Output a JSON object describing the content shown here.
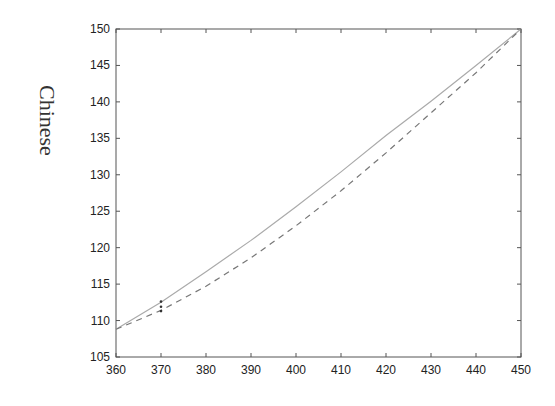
{
  "chart_data": {
    "type": "line",
    "title": "",
    "xlabel": "",
    "ylabel": "Chinese",
    "xlim": [
      360,
      450
    ],
    "ylim": [
      105,
      150
    ],
    "xticks": [
      360,
      370,
      380,
      390,
      400,
      410,
      420,
      430,
      440,
      450
    ],
    "yticks": [
      105,
      110,
      115,
      120,
      125,
      130,
      135,
      140,
      145,
      150
    ],
    "grid": false,
    "legend": null,
    "x": [
      360,
      370,
      380,
      390,
      400,
      410,
      420,
      430,
      440,
      450
    ],
    "series": [
      {
        "name": "solid",
        "style": "solid",
        "color": "#aaaaaa",
        "values": [
          108.8,
          112.5,
          116.7,
          121.0,
          125.6,
          130.4,
          135.4,
          140.1,
          145.0,
          150.0
        ]
      },
      {
        "name": "dashed",
        "style": "dashed",
        "color": "#777777",
        "values": [
          108.8,
          111.4,
          114.7,
          118.6,
          123.0,
          127.8,
          133.0,
          138.5,
          144.0,
          150.0
        ]
      }
    ],
    "markers": [
      {
        "x": 370,
        "y": 112.6
      },
      {
        "x": 370,
        "y": 111.9
      },
      {
        "x": 370,
        "y": 111.3
      }
    ]
  }
}
